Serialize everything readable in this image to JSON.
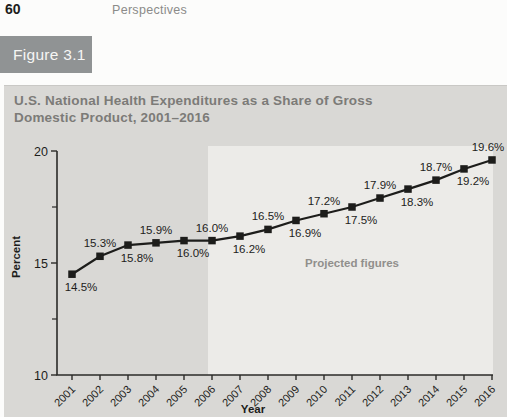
{
  "page": {
    "page_number": "60",
    "running_header": "Perspectives",
    "figure_label": "Figure 3.1"
  },
  "chart_data": {
    "type": "line",
    "title_line1": "U.S. National Health Expenditures as a Share of Gross",
    "title_line2": "Domestic Product, 2001–2016",
    "xlabel": "Year",
    "ylabel": "Percent",
    "ylim": [
      10,
      20
    ],
    "yticks": [
      10,
      15,
      20
    ],
    "yticks_minor": [
      12.5,
      17.5
    ],
    "categories": [
      2001,
      2002,
      2003,
      2004,
      2005,
      2006,
      2007,
      2008,
      2009,
      2010,
      2011,
      2012,
      2013,
      2014,
      2015,
      2016
    ],
    "values": [
      14.5,
      15.3,
      15.8,
      15.9,
      16.0,
      16.0,
      16.2,
      16.5,
      16.9,
      17.2,
      17.5,
      17.9,
      18.3,
      18.7,
      19.2,
      19.6
    ],
    "point_labels": [
      "14.5%",
      "15.3%",
      "15.8%",
      "15.9%",
      "16.0%",
      "16.0%",
      "16.2%",
      "16.5%",
      "16.9%",
      "17.2%",
      "17.5%",
      "17.9%",
      "18.3%",
      "18.7%",
      "19.2%",
      "19.6%"
    ],
    "label_positions": [
      "below",
      "above",
      "below",
      "above",
      "below",
      "above",
      "below",
      "above",
      "below",
      "above",
      "below",
      "above",
      "below",
      "above",
      "below",
      "above"
    ],
    "annotation": "Projected figures",
    "projected_range": [
      2006,
      2016
    ],
    "legend": "none",
    "grid": "off",
    "colors": {
      "ink": "#1d1d1b",
      "axis": "#2b2b29",
      "panel_bg": "#d9d8d5",
      "projected_bg": "#ecebe8",
      "title_text": "#7c7b78",
      "annotation_text": "#918f8c",
      "figure_label_bg": "#909394",
      "figure_label_text": "#f6f6f4",
      "running_header_text": "#8b8b89"
    }
  }
}
